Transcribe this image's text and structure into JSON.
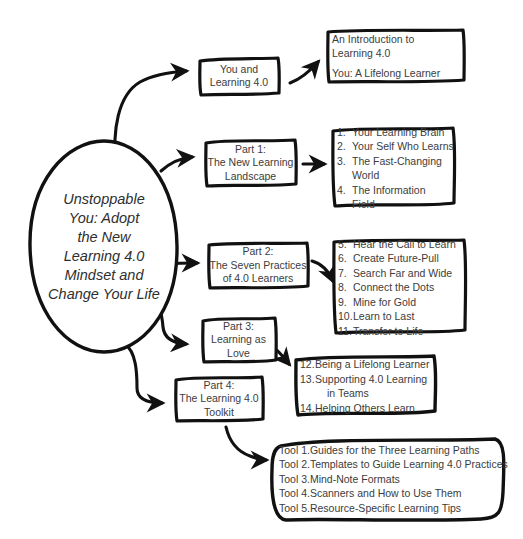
{
  "diagram": {
    "title": "Unstoppable You: Adopt the New Learning 4.0 Mindset and Change Your Life",
    "type": "hand-drawn book structure mind map",
    "ink_color": "#111111",
    "text_color": "#3c3c3c",
    "background_color": "#ffffff"
  },
  "hub": {
    "name": "central-node",
    "lines": [
      "Unstoppable",
      "You: Adopt",
      "the New",
      "Learning 4.0",
      "Mindset and",
      "Change Your Life"
    ]
  },
  "branches": [
    {
      "id": "intro",
      "label_lines": [
        "You and",
        "Learning 4.0"
      ],
      "detail_type": "paragraph",
      "paragraphs": [
        [
          "An Introduction to",
          "Learning 4.0"
        ],
        [
          "You: A Lifelong Learner"
        ]
      ]
    },
    {
      "id": "part1",
      "label_lines": [
        "Part 1:",
        "The New Learning",
        "Landscape"
      ],
      "detail_type": "numbered-list",
      "items": [
        {
          "num": "1.",
          "text": "Your Learning Brain"
        },
        {
          "num": "2.",
          "text": "Your Self Who Learns"
        },
        {
          "num": "3.",
          "text": "The Fast-Changing"
        },
        {
          "num": "",
          "text": "World",
          "continuation": true
        },
        {
          "num": "4.",
          "text": "The Information"
        },
        {
          "num": "",
          "text": "Field",
          "continuation": true
        }
      ]
    },
    {
      "id": "part2",
      "label_lines": [
        "Part 2:",
        "The Seven Practices",
        "of 4.0 Learners"
      ],
      "detail_type": "numbered-list",
      "items": [
        {
          "num": "5.",
          "text": "Hear the Call to Learn"
        },
        {
          "num": "6.",
          "text": "Create Future-Pull"
        },
        {
          "num": "7.",
          "text": "Search Far and Wide"
        },
        {
          "num": "8.",
          "text": "Connect the Dots"
        },
        {
          "num": "9.",
          "text": "Mine for Gold"
        },
        {
          "num": "10.",
          "text": "Learn to Last"
        },
        {
          "num": "11.",
          "text": "Transfer to Life"
        }
      ]
    },
    {
      "id": "part3",
      "label_lines": [
        "Part 3:",
        "Learning as",
        "Love"
      ],
      "detail_type": "numbered-list",
      "items": [
        {
          "num": "12.",
          "text": "Being a Lifelong Learner"
        },
        {
          "num": "13.",
          "text": "Supporting 4.0 Learning"
        },
        {
          "num": "",
          "text": "in Teams",
          "continuation": true
        },
        {
          "num": "14.",
          "text": "Helping Others Learn"
        }
      ]
    },
    {
      "id": "part4",
      "label_lines": [
        "Part 4:",
        "The Learning 4.0",
        "Toolkit"
      ],
      "detail_type": "numbered-list",
      "items": [
        {
          "num": "Tool 1.",
          "text": "Guides for the Three Learning Paths"
        },
        {
          "num": "Tool 2.",
          "text": "Templates to Guide Learning 4.0 Practices"
        },
        {
          "num": "Tool 3.",
          "text": "Mind-Note Formats"
        },
        {
          "num": "Tool 4.",
          "text": "Scanners and How to Use Them"
        },
        {
          "num": "Tool 5.",
          "text": "Resource-Specific Learning Tips"
        }
      ]
    }
  ]
}
